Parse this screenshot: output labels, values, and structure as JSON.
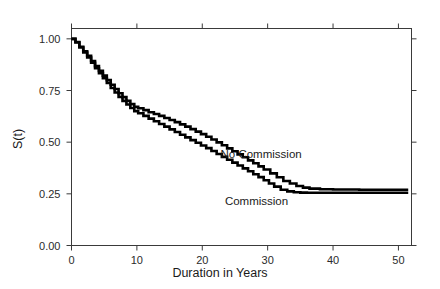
{
  "chart_data": {
    "type": "line",
    "title": "",
    "xlabel": "Duration in Years",
    "ylabel": "S(t)",
    "xlim": [
      0,
      52
    ],
    "ylim": [
      0.0,
      1.05
    ],
    "xticks": [
      0,
      10,
      20,
      30,
      40,
      50
    ],
    "xtick_labels": [
      "0",
      "10",
      "20",
      "30",
      "40",
      "50"
    ],
    "yticks": [
      0.0,
      0.25,
      0.5,
      0.75,
      1.0
    ],
    "ytick_labels": [
      "0.00",
      "0.25",
      "0.50",
      "0.75",
      "1.00"
    ],
    "grid": false,
    "legend_position": "inline-annotation",
    "step_style": "post",
    "series": [
      {
        "name": "No Commission",
        "label_x": 29.0,
        "label_y": 0.425,
        "x": [
          0,
          0.6,
          1.2,
          1.8,
          2.4,
          3.0,
          3.6,
          4.2,
          4.8,
          5.4,
          6.0,
          6.6,
          7.2,
          7.8,
          8.4,
          9.0,
          9.6,
          10.2,
          11.0,
          11.8,
          12.6,
          13.4,
          14.2,
          15.0,
          15.8,
          16.6,
          17.4,
          18.2,
          19.0,
          19.8,
          20.6,
          21.4,
          22.2,
          23.0,
          23.8,
          24.6,
          25.4,
          26.2,
          27.0,
          27.8,
          28.6,
          29.4,
          30.4,
          31.4,
          32.4,
          33.4,
          34.4,
          35.4,
          36.4,
          38.0,
          40.0,
          44.0,
          48.0,
          51.5
        ],
        "y": [
          1.0,
          0.985,
          0.962,
          0.94,
          0.918,
          0.893,
          0.868,
          0.845,
          0.822,
          0.8,
          0.778,
          0.757,
          0.737,
          0.718,
          0.7,
          0.684,
          0.671,
          0.664,
          0.655,
          0.645,
          0.636,
          0.627,
          0.617,
          0.607,
          0.597,
          0.586,
          0.575,
          0.563,
          0.551,
          0.539,
          0.526,
          0.513,
          0.499,
          0.485,
          0.47,
          0.456,
          0.441,
          0.427,
          0.412,
          0.398,
          0.383,
          0.368,
          0.349,
          0.33,
          0.312,
          0.3,
          0.288,
          0.28,
          0.275,
          0.272,
          0.271,
          0.27,
          0.27,
          0.27
        ]
      },
      {
        "name": "Commission",
        "label_x": 28.3,
        "label_y": 0.195,
        "x": [
          0,
          0.6,
          1.2,
          1.8,
          2.4,
          3.0,
          3.6,
          4.2,
          4.8,
          5.4,
          6.0,
          6.6,
          7.2,
          7.8,
          8.4,
          9.0,
          9.6,
          10.2,
          11.0,
          11.8,
          12.6,
          13.4,
          14.2,
          15.0,
          15.8,
          16.6,
          17.4,
          18.2,
          19.0,
          19.8,
          20.6,
          21.4,
          22.2,
          23.0,
          23.8,
          24.6,
          25.4,
          26.2,
          27.0,
          27.8,
          28.6,
          29.4,
          30.2,
          31.0,
          32.0,
          33.0,
          34.0,
          35.0,
          36.0,
          38.0,
          41.0,
          45.0,
          49.0,
          51.5
        ],
        "y": [
          1.0,
          0.982,
          0.958,
          0.934,
          0.91,
          0.884,
          0.858,
          0.834,
          0.81,
          0.786,
          0.762,
          0.74,
          0.719,
          0.7,
          0.682,
          0.665,
          0.65,
          0.64,
          0.627,
          0.614,
          0.601,
          0.588,
          0.575,
          0.562,
          0.549,
          0.536,
          0.523,
          0.51,
          0.497,
          0.484,
          0.471,
          0.457,
          0.443,
          0.429,
          0.415,
          0.401,
          0.387,
          0.373,
          0.359,
          0.345,
          0.331,
          0.316,
          0.3,
          0.285,
          0.27,
          0.262,
          0.258,
          0.256,
          0.255,
          0.255,
          0.255,
          0.255,
          0.255,
          0.255
        ]
      }
    ]
  }
}
